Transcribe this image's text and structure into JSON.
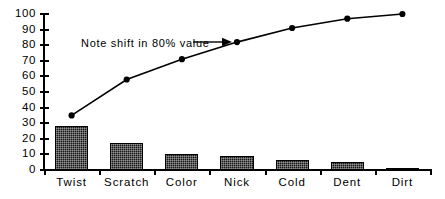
{
  "chart_data": {
    "type": "bar",
    "title": "",
    "subtitle": "",
    "xlabel": "",
    "ylabel": "",
    "categories": [
      "Twist",
      "Scratch",
      "Color",
      "Nick",
      "Cold",
      "Dent",
      "Dirt"
    ],
    "values": [
      28,
      17.5,
      10,
      9,
      6.5,
      5,
      1.5
    ],
    "series": [
      {
        "name": "Count",
        "type": "bar",
        "values": [
          28,
          17.5,
          10,
          9,
          6.5,
          5,
          1.5
        ]
      },
      {
        "name": "Cumulative %",
        "type": "line",
        "values": [
          35,
          58,
          71,
          82,
          91,
          97,
          100
        ]
      }
    ],
    "ylim": [
      0,
      100
    ],
    "yticks": [
      0,
      10,
      20,
      30,
      40,
      50,
      60,
      70,
      80,
      90,
      100
    ],
    "ytick_labels": [
      "0",
      "10",
      "20",
      "30",
      "40",
      "50",
      "60",
      "70",
      "80",
      "90",
      "100"
    ],
    "grid": false,
    "legend": "none",
    "annotations": [
      {
        "text": "Note shift in 80% value",
        "points_to_category": "Nick",
        "points_to_value": 82,
        "arrow": "right"
      }
    ],
    "colors": {
      "bar_fill": "#181818",
      "bar_edge": "#000000",
      "line": "#000000",
      "marker": "#000000",
      "axis": "#000000",
      "background": "#ffffff"
    }
  }
}
